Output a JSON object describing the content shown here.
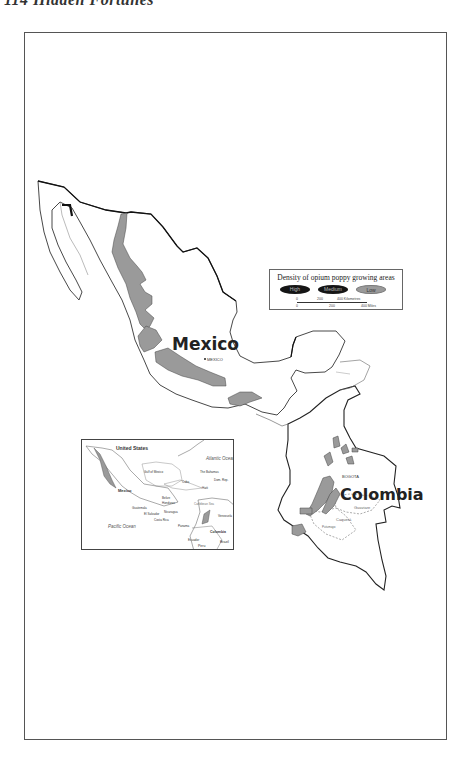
{
  "page": {
    "running_head": "114 Hidden Fortunes"
  },
  "map": {
    "countries": {
      "mexico": "Mexico",
      "colombia": "Colombia"
    },
    "capitals": {
      "mexico_city": "MEXICO",
      "bogota": "BOGOTA"
    },
    "regions": {
      "guaviare": "Guaviare",
      "caqueta": "Caquetá",
      "putumayo": "Putumayo"
    }
  },
  "legend": {
    "title": "Density of opium poppy growing areas",
    "categories": [
      {
        "label": "High",
        "color": "#151515"
      },
      {
        "label": "Medium",
        "color": "#151515"
      },
      {
        "label": "Low",
        "color": "#9a9a9a"
      }
    ],
    "scale": {
      "km_ticks": [
        "0",
        "200",
        "400 Kilometres"
      ],
      "mile_ticks": [
        "0",
        "200",
        "400 Miles"
      ]
    }
  },
  "inset": {
    "labels": {
      "united_states": "United States",
      "atlantic_ocean": "Atlantic Ocean",
      "gulf_of_mexico": "Gulf of Mexico",
      "the_bahamas": "The Bahamas",
      "cuba": "Cuba",
      "dom_rep": "Dom. Rep.",
      "haiti": "Haiti",
      "mexico": "Mexico",
      "belize": "Belize",
      "honduras": "Honduras",
      "guatemala": "Guatemala",
      "el_salvador": "El Salvador",
      "nicaragua": "Nicaragua",
      "caribbean_sea": "Caribbean Sea",
      "costa_rica": "Costa Rica",
      "panama": "Panama",
      "venezuela": "Venezuela",
      "colombia": "Colombia",
      "pacific_ocean": "Pacific Ocean",
      "ecuador": "Ecuador",
      "peru": "Peru",
      "brazil": "Brazil"
    }
  },
  "colors": {
    "poppy_low": "#9a9a9a",
    "poppy_high": "#151515",
    "border": "#222222",
    "coast": "#666666"
  }
}
